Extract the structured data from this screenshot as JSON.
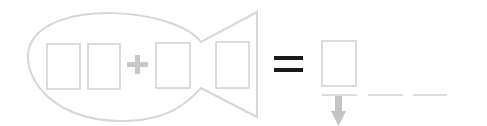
{
  "puzzle": {
    "description": "fish-shaped addition puzzle",
    "operator": "+",
    "equals": "=",
    "input_boxes": [
      {
        "id": "digit-1",
        "value": ""
      },
      {
        "id": "digit-2",
        "value": ""
      },
      {
        "id": "addend-1",
        "value": ""
      },
      {
        "id": "addend-2",
        "value": ""
      }
    ],
    "answer_box": {
      "value": ""
    },
    "answer_blanks": 3
  },
  "colors": {
    "outline": "#d6d6d6",
    "box": "#d0d0d0",
    "plus": "#c8c8c8",
    "equals": "#1a1a1a",
    "arrow": "#c4c4c4"
  }
}
